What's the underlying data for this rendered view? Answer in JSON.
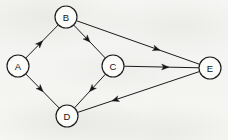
{
  "diagram": {
    "type": "directed-graph",
    "title": "",
    "background_color": "#f6f6f4",
    "ink_color": "#1b1b1b",
    "width": 228,
    "height": 140,
    "nodes": [
      {
        "id": "A",
        "label": "A",
        "x": 18,
        "y": 66,
        "r": 11
      },
      {
        "id": "B",
        "label": "B",
        "x": 66,
        "y": 17,
        "r": 11
      },
      {
        "id": "C",
        "label": "C",
        "x": 113,
        "y": 66,
        "r": 11
      },
      {
        "id": "D",
        "label": "D",
        "x": 67,
        "y": 116,
        "r": 11
      },
      {
        "id": "E",
        "label": "E",
        "x": 210,
        "y": 68,
        "r": 11
      }
    ],
    "edges": [
      {
        "id": "A-B",
        "from": "A",
        "to": "B",
        "label": "",
        "directed": true,
        "arrow_position": 0.52
      },
      {
        "id": "A-D",
        "from": "A",
        "to": "D",
        "label": "",
        "directed": true,
        "arrow_position": 0.52
      },
      {
        "id": "B-C",
        "from": "B",
        "to": "C",
        "label": "",
        "directed": true,
        "arrow_position": 0.52
      },
      {
        "id": "B-E",
        "from": "B",
        "to": "E",
        "label": "",
        "directed": true,
        "arrow_position": 0.68
      },
      {
        "id": "C-D",
        "from": "C",
        "to": "D",
        "label": "",
        "directed": true,
        "arrow_position": 0.52
      },
      {
        "id": "C-E",
        "from": "C",
        "to": "E",
        "label": "",
        "directed": true,
        "arrow_position": 0.6
      },
      {
        "id": "E-D",
        "from": "E",
        "to": "D",
        "label": "",
        "directed": true,
        "arrow_position": 0.72
      }
    ]
  }
}
